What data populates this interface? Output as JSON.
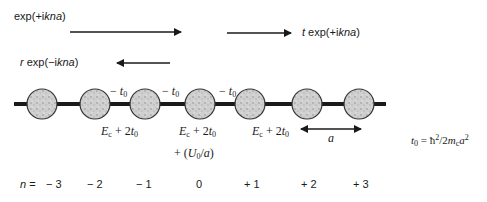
{
  "waves": {
    "incident": {
      "prefix": "",
      "func": "exp(+i",
      "var": "kna",
      "close": ")"
    },
    "transmitted": {
      "prefix": "t",
      "func": " exp(+i",
      "var": "kna",
      "close": ")"
    },
    "reflected": {
      "prefix": "r",
      "func": " exp(−i",
      "var": "kna",
      "close": ")"
    }
  },
  "lattice": {
    "site_count": 7,
    "hopping_label": {
      "sign": "− ",
      "sym": "t",
      "sub": "0"
    },
    "onsite_label": {
      "sym": "E",
      "sub": "c",
      "rest": " + 2",
      "t": "t",
      "tsub": "0"
    },
    "impurity_extra": {
      "text": "+ (",
      "U": "U",
      "Usub": "0",
      "rest": "/",
      "a": "a",
      "close": ")"
    },
    "spacing_label": "a"
  },
  "definition": {
    "lhs": "t",
    "lhs_sub": "0",
    "eq": " = ħ",
    "sup1": "2",
    "rest": "/2",
    "m": "m",
    "msub": "c",
    "a": "a",
    "sup2": "2"
  },
  "indices": {
    "prefix_var": "n",
    "prefix_eq": " = ",
    "values": [
      "− 3",
      "− 2",
      "− 1",
      "0",
      "+ 1",
      "+ 2",
      "+ 3"
    ]
  },
  "colors": {
    "line": "#1a1a1a",
    "site_fill": "#c8c8c8",
    "site_stroke": "#333333"
  }
}
